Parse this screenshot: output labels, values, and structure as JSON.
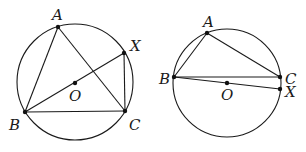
{
  "figures": [
    {
      "id": "left",
      "circle": {
        "cx": 75,
        "cy": 82,
        "r": 58
      },
      "points": {
        "A": {
          "x": 58,
          "y": 27,
          "label": "A",
          "lx": 52,
          "ly": 20
        },
        "B": {
          "x": 25,
          "y": 112,
          "label": "B",
          "lx": 9,
          "ly": 130
        },
        "C": {
          "x": 125,
          "y": 111,
          "label": "C",
          "lx": 129,
          "ly": 130
        },
        "X": {
          "x": 124,
          "y": 53,
          "label": "X",
          "lx": 130,
          "ly": 51
        },
        "O": {
          "x": 75,
          "y": 83,
          "label": "O",
          "lx": 69,
          "ly": 101
        }
      },
      "segments": [
        [
          "A",
          "B"
        ],
        [
          "A",
          "C"
        ],
        [
          "B",
          "C"
        ],
        [
          "B",
          "X"
        ],
        [
          "X",
          "C"
        ]
      ]
    },
    {
      "id": "right",
      "circle": {
        "cx": 227,
        "cy": 83,
        "r": 54
      },
      "points": {
        "A": {
          "x": 207,
          "y": 33,
          "label": "A",
          "lx": 203,
          "ly": 27
        },
        "B": {
          "x": 174,
          "y": 77,
          "label": "B",
          "lx": 159,
          "ly": 84
        },
        "C": {
          "x": 280,
          "y": 77,
          "label": "C",
          "lx": 285,
          "ly": 84
        },
        "X": {
          "x": 280,
          "y": 89,
          "label": "X",
          "lx": 285,
          "ly": 97
        },
        "O": {
          "x": 227,
          "y": 83,
          "label": "O",
          "lx": 221,
          "ly": 100
        }
      },
      "segments": [
        [
          "A",
          "B"
        ],
        [
          "A",
          "C"
        ],
        [
          "B",
          "C"
        ],
        [
          "B",
          "X"
        ]
      ]
    }
  ]
}
